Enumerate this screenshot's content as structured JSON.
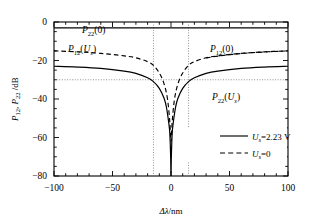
{
  "chart_data": {
    "type": "line",
    "title": "",
    "xlabel": "Δλ/nm",
    "ylabel": "P12 , P22 /dB",
    "xlim": [
      -100,
      100
    ],
    "ylim": [
      -80,
      0
    ],
    "xticks": [
      -100,
      -50,
      0,
      50,
      100
    ],
    "yticks": [
      0,
      -20,
      -40,
      -60,
      -80
    ],
    "xtick_labels": [
      "−100",
      "−50",
      "0",
      "50",
      "100"
    ],
    "ytick_labels": [
      "0",
      "−20",
      "−40",
      "−60",
      "−80"
    ],
    "grid": false,
    "minor_ticks": true,
    "guides": {
      "horizontal_db": -30,
      "vertical_nm": [
        -15,
        15
      ],
      "style": "dotted"
    },
    "legend": {
      "position": "lower-right-inside",
      "entries": [
        {
          "style": "solid",
          "label": "U =2.23 V",
          "symbol_label": "U",
          "sub": "s",
          "value": "=2.23 V"
        },
        {
          "style": "dashed",
          "label": "U =0",
          "symbol_label": "U",
          "sub": "s",
          "value": "=0"
        }
      ]
    },
    "series": [
      {
        "name": "P22(0)",
        "style": "solid",
        "label": "P22(0)",
        "label_base": "P",
        "label_sub": "22",
        "label_arg": "(0)",
        "description": "flat horizontal line near -3 dB",
        "x": [
          -100,
          -50,
          0,
          50,
          100
        ],
        "values": [
          -3,
          -3,
          -3,
          -3,
          -3
        ]
      },
      {
        "name": "P12(Us)",
        "style": "dashed",
        "label": "P12(Us)",
        "label_base": "P",
        "label_sub": "12",
        "label_arg": "(U",
        "label_arg_sub": "s",
        "label_arg_end": ")",
        "description": "dashed curve, -15 dB at edges, deep notch at 0 nm",
        "x": [
          -100,
          -80,
          -60,
          -40,
          -30,
          -20,
          -15,
          -10,
          -6,
          -3,
          -1,
          0,
          1,
          3,
          6,
          10,
          15,
          20,
          30,
          40,
          60,
          80,
          100
        ],
        "values": [
          -15,
          -15.5,
          -16.3,
          -17.6,
          -18.6,
          -20.6,
          -22.5,
          -26.5,
          -32,
          -40,
          -52,
          -62,
          -52,
          -40,
          -32,
          -26.5,
          -22.5,
          -20.6,
          -18.6,
          -17.6,
          -16.3,
          -15.5,
          -15
        ]
      },
      {
        "name": "P22(Us)",
        "style": "solid",
        "label": "P22(Us)",
        "label_base": "P",
        "label_sub": "22",
        "label_arg": "(U",
        "label_arg_sub": "s",
        "label_arg_end": ")",
        "description": "solid curve, -23 dB at edges, deepest notch at 0 nm reaching below -80 dB",
        "x": [
          -100,
          -80,
          -60,
          -40,
          -30,
          -20,
          -15,
          -10,
          -6,
          -4,
          -2,
          -1,
          -0.3,
          0,
          0.3,
          1,
          2,
          4,
          6,
          10,
          15,
          20,
          30,
          40,
          60,
          80,
          100
        ],
        "values": [
          -23,
          -23.4,
          -24.1,
          -25.5,
          -26.7,
          -29,
          -31,
          -34.5,
          -39.5,
          -44,
          -52,
          -58,
          -70,
          -82,
          -70,
          -58,
          -52,
          -44,
          -39.5,
          -34.5,
          -31,
          -29,
          -26.7,
          -25.5,
          -24.1,
          -23.4,
          -23
        ]
      },
      {
        "name": "P12(0)",
        "style": "dashed",
        "label": "P12(0)",
        "label_base": "P",
        "label_sub": "12",
        "label_arg": "(0)",
        "description": "dashed branch labelled on upper right, same as P12(Us) family",
        "x": [
          30,
          50,
          70,
          100
        ],
        "values": [
          -18.6,
          -17,
          -15.9,
          -15
        ]
      }
    ],
    "annotations": [
      {
        "name": "P22(0)",
        "x": -63,
        "y": -2,
        "text": "P22(0)"
      },
      {
        "name": "P12(Us)",
        "x": -63,
        "y": -12,
        "text": "P12(Us)"
      },
      {
        "name": "P12(0)",
        "x": 55,
        "y": -11,
        "text": "P12(0)"
      },
      {
        "name": "P22(Us)",
        "x": 55,
        "y": -38,
        "text": "P22(Us)"
      }
    ]
  }
}
